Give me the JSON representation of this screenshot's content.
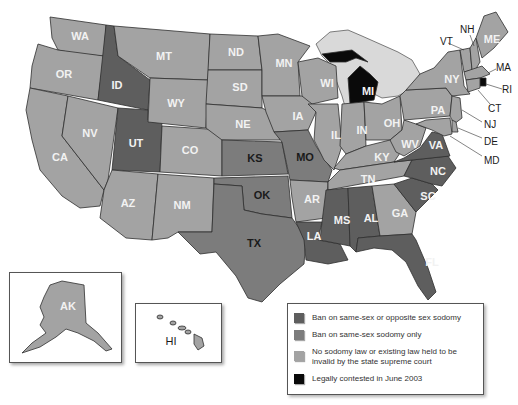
{
  "colors": {
    "both": "#5e5e5e",
    "same_sex_only": "#7c7c7c",
    "none_or_invalid": "#a3a3a3",
    "contested": "#0a0a0a",
    "water": "#d9d9d9",
    "border": "#2e2e2e"
  },
  "legend": {
    "items": [
      {
        "key": "both",
        "label": "Ban on same-sex or opposite sex sodomy"
      },
      {
        "key": "same_sex_only",
        "label": "Ban on same-sex sodomy only"
      },
      {
        "key": "none_or_invalid",
        "label": "No sodomy law or existing law held to be invalid by the state supreme court"
      },
      {
        "key": "contested",
        "label": "Legally contested in June 2003"
      }
    ]
  },
  "states": {
    "WA": "none_or_invalid",
    "OR": "none_or_invalid",
    "CA": "none_or_invalid",
    "NV": "none_or_invalid",
    "ID": "both",
    "UT": "both",
    "MT": "none_or_invalid",
    "WY": "none_or_invalid",
    "CO": "none_or_invalid",
    "AZ": "none_or_invalid",
    "NM": "none_or_invalid",
    "ND": "none_or_invalid",
    "SD": "none_or_invalid",
    "NE": "none_or_invalid",
    "KS": "same_sex_only",
    "OK": "same_sex_only",
    "TX": "same_sex_only",
    "MN": "none_or_invalid",
    "IA": "none_or_invalid",
    "MO": "same_sex_only",
    "AR": "none_or_invalid",
    "LA": "both",
    "WI": "none_or_invalid",
    "IL": "none_or_invalid",
    "MI": "contested",
    "IN": "none_or_invalid",
    "OH": "none_or_invalid",
    "KY": "none_or_invalid",
    "TN": "none_or_invalid",
    "MS": "both",
    "AL": "both",
    "GA": "none_or_invalid",
    "FL": "both",
    "SC": "both",
    "NC": "both",
    "VA": "both",
    "WV": "none_or_invalid",
    "PA": "none_or_invalid",
    "NY": "none_or_invalid",
    "VT": "none_or_invalid",
    "NH": "none_or_invalid",
    "ME": "none_or_invalid",
    "MA": "none_or_invalid",
    "RI": "contested",
    "CT": "none_or_invalid",
    "NJ": "none_or_invalid",
    "DE": "none_or_invalid",
    "MD": "none_or_invalid",
    "AK": "none_or_invalid",
    "HI": "none_or_invalid"
  },
  "labels": {
    "WA": "WA",
    "OR": "OR",
    "CA": "CA",
    "NV": "NV",
    "ID": "ID",
    "UT": "UT",
    "MT": "MT",
    "WY": "WY",
    "CO": "CO",
    "AZ": "AZ",
    "NM": "NM",
    "ND": "ND",
    "SD": "SD",
    "NE": "NE",
    "KS": "KS",
    "OK": "OK",
    "TX": "TX",
    "MN": "MN",
    "IA": "IA",
    "MO": "MO",
    "AR": "AR",
    "LA": "LA",
    "WI": "WI",
    "IL": "IL",
    "MI": "MI",
    "IN": "IN",
    "OH": "OH",
    "KY": "KY",
    "TN": "TN",
    "MS": "MS",
    "AL": "AL",
    "GA": "GA",
    "FL": "FL",
    "SC": "SC",
    "NC": "NC",
    "VA": "VA",
    "WV": "WV",
    "PA": "PA",
    "NY": "NY",
    "VT": "VT",
    "NH": "NH",
    "ME": "ME",
    "MA": "MA",
    "RI": "RI",
    "CT": "CT",
    "NJ": "NJ",
    "DE": "DE",
    "MD": "MD",
    "AK": "AK",
    "HI": "HI"
  }
}
